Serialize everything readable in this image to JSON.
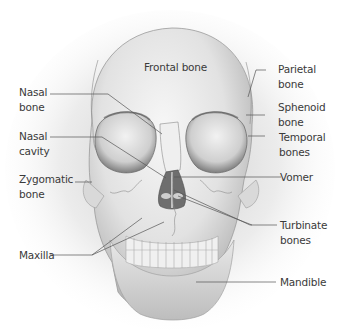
{
  "diagram": {
    "labels": [
      {
        "id": "frontal",
        "text": "Frontal bone",
        "side": "center"
      },
      {
        "id": "nasal-bone",
        "text": "Nasal\nbone",
        "side": "left"
      },
      {
        "id": "nasal-cavity",
        "text": "Nasal\ncavity",
        "side": "left"
      },
      {
        "id": "zygomatic",
        "text": "Zygomatic\nbone",
        "side": "left"
      },
      {
        "id": "maxilla",
        "text": "Maxilla",
        "side": "left"
      },
      {
        "id": "parietal",
        "text": "Parietal\nbone",
        "side": "right"
      },
      {
        "id": "sphenoid",
        "text": "Sphenoid\nbone",
        "side": "right"
      },
      {
        "id": "temporal",
        "text": "Temporal\nbones",
        "side": "right"
      },
      {
        "id": "vomer",
        "text": "Vomer",
        "side": "right"
      },
      {
        "id": "turbinate",
        "text": "Turbinate\nbones",
        "side": "right"
      },
      {
        "id": "mandible",
        "text": "Mandible",
        "side": "right"
      }
    ],
    "colors": {
      "bone": "#e6e6e6",
      "shadow": "#8a8a8a",
      "leader_line": "#555555",
      "text": "#3a3a3a"
    }
  }
}
